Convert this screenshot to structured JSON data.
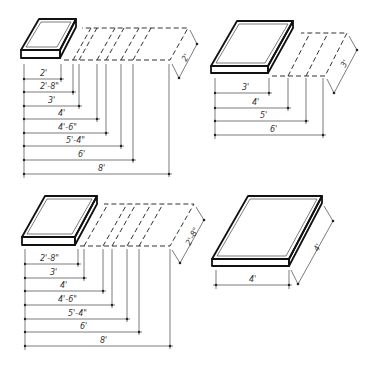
{
  "figures": [
    {
      "id": "top-left",
      "slab_size": "2'",
      "depth_label": "2'",
      "width_labels": [
        "2'",
        "2'-8\"",
        "3'",
        "4'",
        "4'-6\"",
        "5'-4\"",
        "6'",
        "8'"
      ]
    },
    {
      "id": "top-right",
      "slab_size": "3'",
      "depth_label": "3'",
      "width_labels": [
        "3'",
        "4'",
        "5'",
        "6'"
      ]
    },
    {
      "id": "bottom-left",
      "slab_size": "2'-8\"",
      "depth_label": "2'-8\"",
      "width_labels": [
        "2'-8\"",
        "3'",
        "4'",
        "4'-6\"",
        "5'-4\"",
        "6'",
        "8'"
      ]
    },
    {
      "id": "bottom-right",
      "slab_size": "4'",
      "depth_label": "4'",
      "width_labels": [
        "4'"
      ]
    }
  ],
  "colors": {
    "line": "#222222",
    "background": "#ffffff"
  }
}
